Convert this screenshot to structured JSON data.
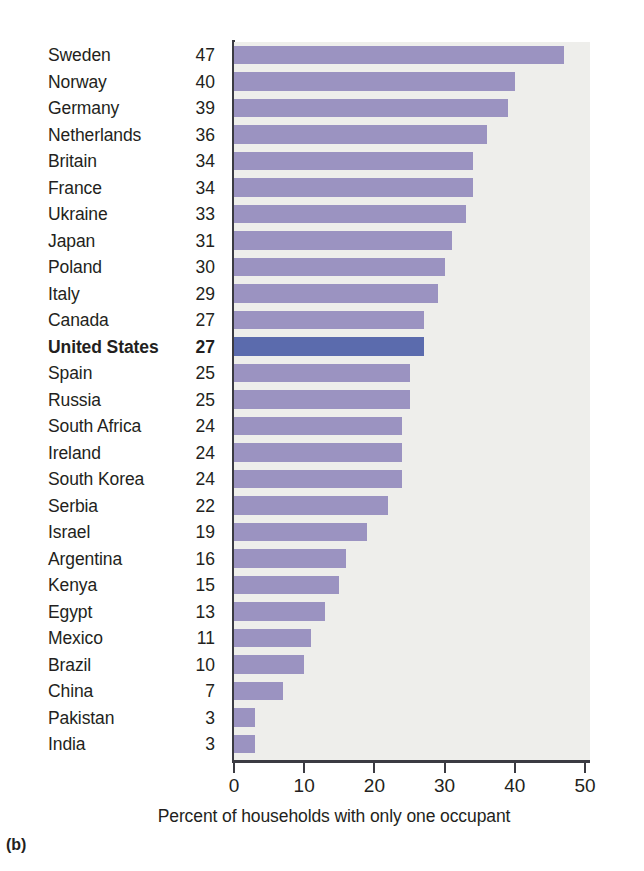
{
  "panel": {
    "label": "(b)"
  },
  "axis": {
    "caption": "Percent of households with only one occupant",
    "ticks": [
      "0",
      "10",
      "20",
      "30",
      "40",
      "50"
    ]
  },
  "colors": {
    "bar": "#9b93c1",
    "bar_highlight": "#5b6bad",
    "plot_background": "#eeeeeb",
    "axis": "#3b3b42",
    "text": "#231f20"
  },
  "chart_data": {
    "type": "bar",
    "title": "",
    "subtitle": "",
    "xlabel": "Percent of households with only one occupant",
    "ylabel": "",
    "orientation": "horizontal",
    "xlim": [
      0,
      50
    ],
    "xticks": [
      0,
      10,
      20,
      30,
      40,
      50
    ],
    "grid": false,
    "legend": false,
    "highlight": "United States",
    "categories": [
      "Sweden",
      "Norway",
      "Germany",
      "Netherlands",
      "Britain",
      "France",
      "Ukraine",
      "Japan",
      "Poland",
      "Italy",
      "Canada",
      "United States",
      "Spain",
      "Russia",
      "South Africa",
      "Ireland",
      "South Korea",
      "Serbia",
      "Israel",
      "Argentina",
      "Kenya",
      "Egypt",
      "Mexico",
      "Brazil",
      "China",
      "Pakistan",
      "India"
    ],
    "values": [
      47,
      40,
      39,
      36,
      34,
      34,
      33,
      31,
      30,
      29,
      27,
      27,
      25,
      25,
      24,
      24,
      24,
      22,
      19,
      16,
      15,
      13,
      11,
      10,
      7,
      3,
      3
    ],
    "rows": [
      {
        "name": "Sweden",
        "value": 47,
        "highlight": false
      },
      {
        "name": "Norway",
        "value": 40,
        "highlight": false
      },
      {
        "name": "Germany",
        "value": 39,
        "highlight": false
      },
      {
        "name": "Netherlands",
        "value": 36,
        "highlight": false
      },
      {
        "name": "Britain",
        "value": 34,
        "highlight": false
      },
      {
        "name": "France",
        "value": 34,
        "highlight": false
      },
      {
        "name": "Ukraine",
        "value": 33,
        "highlight": false
      },
      {
        "name": "Japan",
        "value": 31,
        "highlight": false
      },
      {
        "name": "Poland",
        "value": 30,
        "highlight": false
      },
      {
        "name": "Italy",
        "value": 29,
        "highlight": false
      },
      {
        "name": "Canada",
        "value": 27,
        "highlight": false
      },
      {
        "name": "United States",
        "value": 27,
        "highlight": true
      },
      {
        "name": "Spain",
        "value": 25,
        "highlight": false
      },
      {
        "name": "Russia",
        "value": 25,
        "highlight": false
      },
      {
        "name": "South Africa",
        "value": 24,
        "highlight": false
      },
      {
        "name": "Ireland",
        "value": 24,
        "highlight": false
      },
      {
        "name": "South Korea",
        "value": 24,
        "highlight": false
      },
      {
        "name": "Serbia",
        "value": 22,
        "highlight": false
      },
      {
        "name": "Israel",
        "value": 19,
        "highlight": false
      },
      {
        "name": "Argentina",
        "value": 16,
        "highlight": false
      },
      {
        "name": "Kenya",
        "value": 15,
        "highlight": false
      },
      {
        "name": "Egypt",
        "value": 13,
        "highlight": false
      },
      {
        "name": "Mexico",
        "value": 11,
        "highlight": false
      },
      {
        "name": "Brazil",
        "value": 10,
        "highlight": false
      },
      {
        "name": "China",
        "value": 7,
        "highlight": false
      },
      {
        "name": "Pakistan",
        "value": 3,
        "highlight": false
      },
      {
        "name": "India",
        "value": 3,
        "highlight": false
      }
    ]
  }
}
